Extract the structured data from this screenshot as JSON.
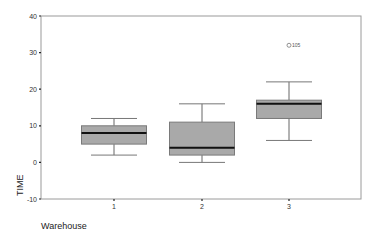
{
  "chart_data": {
    "type": "boxplot",
    "title": "",
    "xlabel": "Warehouse",
    "ylabel": "TIME",
    "ylim": [
      -10,
      40
    ],
    "yticks": [
      -10,
      0,
      10,
      20,
      30,
      40
    ],
    "categories": [
      "1",
      "2",
      "3"
    ],
    "grid": false,
    "legend": null,
    "boxes": [
      {
        "category": "1",
        "whisker_low": 2,
        "q1": 5,
        "median": 8,
        "q3": 10,
        "whisker_high": 12,
        "outliers": []
      },
      {
        "category": "2",
        "whisker_low": 0,
        "q1": 2,
        "median": 4,
        "q3": 11,
        "whisker_high": 16,
        "outliers": []
      },
      {
        "category": "3",
        "whisker_low": 6,
        "q1": 12,
        "median": 16,
        "q3": 17,
        "whisker_high": 22,
        "outliers": [
          {
            "value": 32,
            "label": "105"
          }
        ]
      }
    ],
    "colors": {
      "box_fill": "#a9a9a9",
      "box_stroke": "#7a7a7a",
      "median": "#111111",
      "axis": "#8a8a8a"
    }
  },
  "labels": {
    "xlabel": "Warehouse",
    "ylabel": "TIME",
    "yticks": [
      "-10",
      "0",
      "10",
      "20",
      "30",
      "40"
    ],
    "xticks": [
      "1",
      "2",
      "3"
    ],
    "outlier": "105"
  }
}
